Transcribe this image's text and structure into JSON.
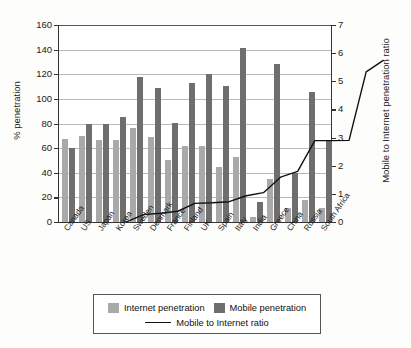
{
  "chart_data": {
    "type": "bar",
    "title": "",
    "subtitle": "",
    "xlabel": "",
    "ylabel": "% penetration",
    "ylabel_secondary": "Mobile to Internet penetration ratio",
    "ylim": [
      0,
      160
    ],
    "ylim_secondary": [
      0,
      7
    ],
    "yticks": [
      0,
      20,
      40,
      60,
      80,
      100,
      120,
      140,
      160
    ],
    "yticks_secondary": [
      0,
      1,
      2,
      3,
      4,
      5,
      6,
      7
    ],
    "grid": true,
    "legend_position": "bottom",
    "categories": [
      "Canada",
      "US",
      "Japan",
      "Korea",
      "Sweden",
      "Denmark",
      "France",
      "Finland",
      "UK",
      "Spain",
      "Italy",
      "India",
      "Greece",
      "China",
      "Russia",
      "South Africa"
    ],
    "series": [
      {
        "name": "Internet penetration",
        "type": "bar",
        "axis": "left",
        "color": "#a9a9a9",
        "values": [
          67.5,
          69.5,
          66.5,
          67,
          76,
          69,
          50,
          62,
          62,
          44.5,
          52.5,
          4,
          35,
          11,
          18,
          11
        ]
      },
      {
        "name": "Mobile penetration",
        "type": "bar",
        "axis": "left",
        "color": "#6e6e6e",
        "values": [
          60,
          80,
          80,
          85,
          118,
          108.5,
          80.5,
          112.5,
          120.5,
          110.5,
          141,
          16,
          128.5,
          39.5,
          105.5,
          67
        ]
      },
      {
        "name": "Mobile to Internet ratio",
        "type": "line",
        "axis": "right",
        "color": "#111111",
        "values": [
          0.89,
          1.15,
          1.2,
          1.27,
          1.55,
          1.57,
          1.61,
          1.82,
          1.93,
          2.48,
          2.69,
          3.78,
          3.78,
          3.79,
          6.22,
          6.63
        ]
      }
    ]
  },
  "legend": {
    "items": [
      {
        "label": "Internet penetration",
        "marker": "square-light"
      },
      {
        "label": "Mobile penetration",
        "marker": "square-dark"
      },
      {
        "label": "Mobile to Internet ratio",
        "marker": "line"
      }
    ]
  }
}
